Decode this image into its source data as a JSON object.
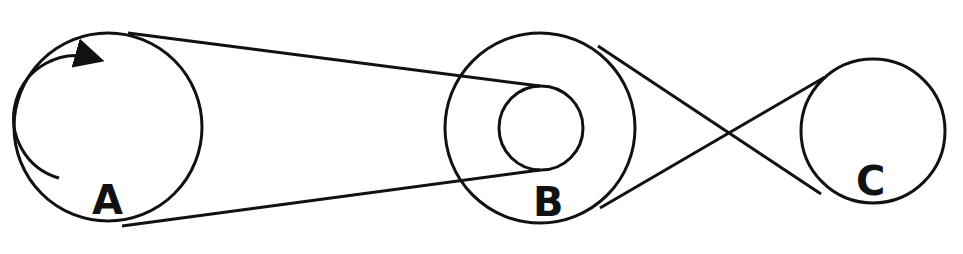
{
  "diagram": {
    "pulleys": [
      {
        "id": "A",
        "label": "A"
      },
      {
        "id": "B",
        "label": "B"
      },
      {
        "id": "C",
        "label": "C"
      }
    ],
    "belts": [
      {
        "from": "A",
        "to": "B (inner)",
        "type": "open"
      },
      {
        "from": "B (outer)",
        "to": "C",
        "type": "crossed"
      }
    ],
    "rotation_indicator": {
      "pulley": "A",
      "direction": "clockwise"
    },
    "colors": {
      "stroke": "#111111",
      "background": "#ffffff"
    }
  }
}
